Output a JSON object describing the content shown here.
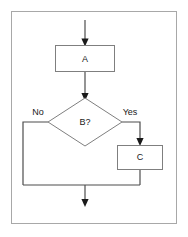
{
  "diagram": {
    "canvas": {
      "width": 188,
      "height": 237,
      "background": "#ffffff"
    },
    "frame": {
      "name": "diagram-border",
      "x": 11,
      "y": 11,
      "width": 166,
      "height": 213,
      "stroke": "#a8a8a8",
      "fill": "#ffffff"
    },
    "colors": {
      "shape_stroke": "#7f7f7f",
      "shape_fill": "#ffffff",
      "connector": "#4d4d4d",
      "arrow_head": "#1a1a1a",
      "text": "#1a1a1a",
      "frame_stroke": "#a8a8a8"
    },
    "nodes": [
      {
        "id": "process-a",
        "type": "process",
        "label": "A",
        "x": 55,
        "y": 45,
        "width": 60,
        "height": 27
      },
      {
        "id": "decision-b",
        "type": "decision",
        "label": "B?",
        "cx": 85,
        "cy": 122,
        "half_width": 37,
        "half_height": 24
      },
      {
        "id": "process-c",
        "type": "process",
        "label": "C",
        "x": 117,
        "y": 145,
        "width": 46,
        "height": 25
      }
    ],
    "edges": [
      {
        "id": "entry-to-a",
        "label": "",
        "from": "start",
        "to": "process-a",
        "arrow": true
      },
      {
        "id": "a-to-b",
        "label": "",
        "from": "process-a",
        "to": "decision-b",
        "arrow": true
      },
      {
        "id": "b-no-branch",
        "label": "No",
        "from": "decision-b",
        "to": "merge",
        "arrow": false,
        "label_x": 38,
        "label_y": 113
      },
      {
        "id": "b-yes-branch",
        "label": "Yes",
        "from": "decision-b",
        "to": "process-c",
        "arrow": true,
        "label_x": 130,
        "label_y": 113
      },
      {
        "id": "c-to-merge",
        "label": "",
        "from": "process-c",
        "to": "merge",
        "arrow": false
      },
      {
        "id": "merge-to-exit",
        "label": "",
        "from": "merge",
        "to": "end",
        "arrow": true
      }
    ],
    "labels": {
      "node_a": "A",
      "node_b": "B?",
      "node_c": "C",
      "branch_no": "No",
      "branch_yes": "Yes"
    }
  }
}
